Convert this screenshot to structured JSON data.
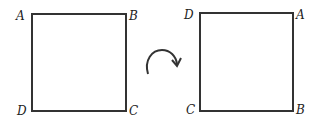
{
  "left_square": {
    "labels": {
      "top_left": "A",
      "top_right": "B",
      "bottom_right": "C",
      "bottom_left": "D"
    }
  },
  "right_square": {
    "labels": {
      "top_left": "D",
      "top_right": "A",
      "bottom_right": "B",
      "bottom_left": "C"
    }
  },
  "arrow": {
    "icon": "clockwise-rotation-arrow-icon"
  },
  "colors": {
    "stroke": "#333333",
    "background": "#ffffff"
  }
}
